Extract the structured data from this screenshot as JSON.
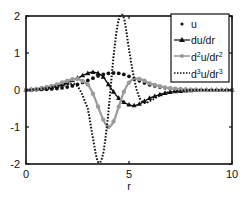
{
  "chart_data": {
    "type": "line",
    "title": "",
    "xlabel": "r",
    "ylabel": "",
    "xlim": [
      0,
      10
    ],
    "ylim": [
      -2,
      2
    ],
    "x_ticks": [
      0,
      5,
      10
    ],
    "y_ticks": [
      -2,
      -1,
      0,
      1,
      2
    ],
    "x_tick_labels": [
      "0",
      "5",
      "10"
    ],
    "y_tick_labels": [
      "-2",
      "-1",
      "0",
      "1",
      "2"
    ],
    "grid": false,
    "legend_position": "upper right",
    "x": [
      0,
      0.5,
      1,
      1.5,
      2,
      2.5,
      3,
      3.25,
      3.5,
      3.75,
      4,
      4.25,
      4.5,
      4.75,
      5,
      5.25,
      5.5,
      5.75,
      6,
      6.5,
      7,
      7.5,
      8,
      8.5,
      9,
      9.5,
      10
    ],
    "series": [
      {
        "name": "u",
        "style": "dots",
        "color": "#111111",
        "values": [
          0,
          0.01,
          0.02,
          0.04,
          0.08,
          0.15,
          0.26,
          0.32,
          0.38,
          0.42,
          0.45,
          0.46,
          0.45,
          0.42,
          0.37,
          0.31,
          0.25,
          0.19,
          0.14,
          0.08,
          0.04,
          0.02,
          0.01,
          0.005,
          0,
          0,
          0
        ]
      },
      {
        "name": "du/dr",
        "style": "line-triangles",
        "color": "#111111",
        "values": [
          0,
          0.02,
          0.05,
          0.1,
          0.2,
          0.32,
          0.45,
          0.48,
          0.45,
          0.35,
          0.15,
          -0.05,
          -0.22,
          -0.33,
          -0.4,
          -0.42,
          -0.38,
          -0.3,
          -0.22,
          -0.12,
          -0.06,
          -0.03,
          -0.01,
          0,
          0,
          0,
          0
        ]
      },
      {
        "name": "d^2u/dr^2",
        "style": "line-circles",
        "color": "#9a9a9a",
        "values": [
          0,
          0.03,
          0.08,
          0.15,
          0.25,
          0.3,
          0.15,
          -0.1,
          -0.45,
          -0.8,
          -1.0,
          -0.85,
          -0.45,
          -0.05,
          0.2,
          0.3,
          0.3,
          0.25,
          0.18,
          0.1,
          0.05,
          0.02,
          0.01,
          0,
          0,
          0,
          0
        ]
      },
      {
        "name": "d^3u/dr^3",
        "style": "dotted",
        "color": "#111111",
        "values": [
          0,
          0.02,
          0.05,
          0.1,
          0.15,
          0.1,
          -0.5,
          -1.3,
          -1.95,
          -1.7,
          -0.6,
          0.9,
          1.9,
          1.95,
          1.1,
          0.3,
          -0.2,
          -0.35,
          -0.3,
          -0.15,
          -0.05,
          -0.02,
          0,
          0,
          0,
          0,
          0
        ]
      }
    ]
  },
  "legend": {
    "items": [
      {
        "label": "u"
      },
      {
        "label": "du/dr"
      },
      {
        "base1": "d",
        "sup1": "2",
        "base2": "u/dr",
        "sup2": "2"
      },
      {
        "base1": "d",
        "sup1": "3",
        "base2": "u/dr",
        "sup2": "3"
      }
    ]
  }
}
